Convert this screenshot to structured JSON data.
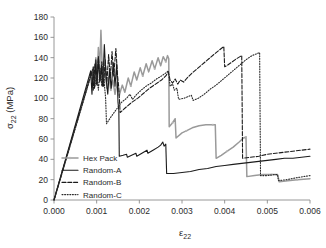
{
  "chart_data": {
    "type": "line",
    "title": "",
    "xlabel": "ε₂₂",
    "xlabel_base": "ε",
    "xlabel_sub": "22",
    "ylabel": "σ₂₂ (MPa)",
    "ylabel_base": "σ",
    "ylabel_sub": "22",
    "ylabel_unit": " (MPa)",
    "xlim": [
      0.0,
      0.006
    ],
    "ylim": [
      0,
      180
    ],
    "xticks": [
      0.0,
      0.001,
      0.002,
      0.003,
      0.004,
      0.005,
      0.006
    ],
    "xtick_labels": [
      "0.000",
      "0.001",
      "0.002",
      "0.003",
      "0.004",
      "0.005",
      "0.006"
    ],
    "yticks": [
      0,
      20,
      40,
      60,
      80,
      100,
      120,
      140,
      160,
      180
    ],
    "ytick_labels": [
      "0",
      "20",
      "40",
      "60",
      "80",
      "100",
      "120",
      "140",
      "160",
      "180"
    ],
    "grid": false,
    "legend_position": "lower-left-inside",
    "series": [
      {
        "name": "Hex Pack",
        "color": "#9a9a9a",
        "style": "solid-marker",
        "width": 1.5,
        "points": [
          [
            0.0,
            0
          ],
          [
            0.0009,
            128
          ],
          [
            0.00094,
            112
          ],
          [
            0.00098,
            140
          ],
          [
            0.00101,
            120
          ],
          [
            0.00104,
            150
          ],
          [
            0.00107,
            128
          ],
          [
            0.0011,
            167
          ],
          [
            0.00114,
            118
          ],
          [
            0.0012,
            126
          ],
          [
            0.00124,
            110
          ],
          [
            0.00129,
            121
          ],
          [
            0.00133,
            108
          ],
          [
            0.00138,
            118
          ],
          [
            0.00143,
            104
          ],
          [
            0.00148,
            116
          ],
          [
            0.00153,
            103
          ],
          [
            0.0016,
            113
          ],
          [
            0.00166,
            106
          ],
          [
            0.00174,
            120
          ],
          [
            0.0018,
            112
          ],
          [
            0.00188,
            126
          ],
          [
            0.00194,
            118
          ],
          [
            0.00202,
            130
          ],
          [
            0.00208,
            122
          ],
          [
            0.00216,
            134
          ],
          [
            0.00222,
            126
          ],
          [
            0.0023,
            137
          ],
          [
            0.00236,
            129
          ],
          [
            0.00244,
            140
          ],
          [
            0.0025,
            132
          ],
          [
            0.00256,
            141
          ],
          [
            0.00262,
            136
          ],
          [
            0.00266,
            142
          ],
          [
            0.00269,
            139
          ],
          [
            0.0027,
            72
          ],
          [
            0.00278,
            76
          ],
          [
            0.00284,
            80
          ],
          [
            0.00286,
            61
          ],
          [
            0.003,
            66
          ],
          [
            0.0031,
            68
          ],
          [
            0.00324,
            71
          ],
          [
            0.0034,
            73
          ],
          [
            0.00356,
            74
          ],
          [
            0.00372,
            74
          ],
          [
            0.00378,
            74
          ],
          [
            0.0038,
            41
          ],
          [
            0.00392,
            44
          ],
          [
            0.00406,
            48
          ],
          [
            0.0042,
            52
          ],
          [
            0.00434,
            57
          ],
          [
            0.00444,
            61
          ],
          [
            0.0045,
            62
          ],
          [
            0.00452,
            23
          ],
          [
            0.0047,
            24
          ],
          [
            0.0049,
            25
          ],
          [
            0.0051,
            25
          ],
          [
            0.00524,
            25
          ],
          [
            0.00528,
            18
          ],
          [
            0.00548,
            19
          ],
          [
            0.0057,
            20
          ],
          [
            0.006,
            21
          ]
        ]
      },
      {
        "name": "Random-A",
        "color": "#1b1b1b",
        "style": "solid",
        "width": 1.1,
        "points": [
          [
            0.0,
            0
          ],
          [
            0.00086,
            127
          ],
          [
            0.00089,
            104
          ],
          [
            0.00092,
            131
          ],
          [
            0.00095,
            110
          ],
          [
            0.00098,
            138
          ],
          [
            0.00101,
            113
          ],
          [
            0.00104,
            141
          ],
          [
            0.00107,
            116
          ],
          [
            0.00111,
            130
          ],
          [
            0.00114,
            112
          ],
          [
            0.00118,
            153
          ],
          [
            0.00122,
            120
          ],
          [
            0.00126,
            104
          ],
          [
            0.0013,
            128
          ],
          [
            0.00134,
            110
          ],
          [
            0.00139,
            135
          ],
          [
            0.00143,
            112
          ],
          [
            0.00147,
            134
          ],
          [
            0.0015,
            96
          ],
          [
            0.00152,
            88
          ],
          [
            0.00153,
            43
          ],
          [
            0.00162,
            44
          ],
          [
            0.0017,
            45
          ],
          [
            0.00172,
            42
          ],
          [
            0.00182,
            44
          ],
          [
            0.00192,
            46
          ],
          [
            0.00194,
            43
          ],
          [
            0.00206,
            46
          ],
          [
            0.00218,
            49
          ],
          [
            0.0022,
            46
          ],
          [
            0.00232,
            49
          ],
          [
            0.00244,
            52
          ],
          [
            0.0025,
            54
          ],
          [
            0.00255,
            57
          ],
          [
            0.00258,
            53
          ],
          [
            0.00262,
            55
          ],
          [
            0.00264,
            26
          ],
          [
            0.0028,
            26
          ],
          [
            0.003,
            27
          ],
          [
            0.0032,
            28
          ],
          [
            0.0034,
            30
          ],
          [
            0.0036,
            31
          ],
          [
            0.0038,
            33
          ],
          [
            0.004,
            34
          ],
          [
            0.0042,
            35
          ],
          [
            0.0044,
            36
          ],
          [
            0.0046,
            37
          ],
          [
            0.0048,
            38
          ],
          [
            0.005,
            39
          ],
          [
            0.0052,
            40
          ],
          [
            0.0054,
            41
          ],
          [
            0.0056,
            41
          ],
          [
            0.0058,
            42
          ],
          [
            0.006,
            43
          ]
        ]
      },
      {
        "name": "Random-B",
        "color": "#1b1b1b",
        "style": "dashed",
        "width": 1.1,
        "points": [
          [
            0.0,
            0
          ],
          [
            0.00088,
            126
          ],
          [
            0.00092,
            108
          ],
          [
            0.00096,
            134
          ],
          [
            0.001,
            114
          ],
          [
            0.00104,
            140
          ],
          [
            0.00108,
            117
          ],
          [
            0.00112,
            136
          ],
          [
            0.00116,
            112
          ],
          [
            0.0012,
            138
          ],
          [
            0.00124,
            116
          ],
          [
            0.00128,
            143
          ],
          [
            0.00132,
            120
          ],
          [
            0.00136,
            146
          ],
          [
            0.0014,
            122
          ],
          [
            0.00145,
            149
          ],
          [
            0.00149,
            122
          ],
          [
            0.00152,
            110
          ],
          [
            0.00155,
            86
          ],
          [
            0.00168,
            91
          ],
          [
            0.00182,
            96
          ],
          [
            0.00196,
            100
          ],
          [
            0.0021,
            105
          ],
          [
            0.00224,
            110
          ],
          [
            0.00238,
            114
          ],
          [
            0.00252,
            118
          ],
          [
            0.00262,
            122
          ],
          [
            0.00268,
            126
          ],
          [
            0.00272,
            118
          ],
          [
            0.00278,
            115
          ],
          [
            0.00284,
            119
          ],
          [
            0.0029,
            114
          ],
          [
            0.00296,
            118
          ],
          [
            0.00304,
            116
          ],
          [
            0.00312,
            120
          ],
          [
            0.00324,
            125
          ],
          [
            0.00338,
            130
          ],
          [
            0.00352,
            135
          ],
          [
            0.00366,
            140
          ],
          [
            0.0038,
            145
          ],
          [
            0.00392,
            149
          ],
          [
            0.00398,
            151
          ],
          [
            0.004,
            131
          ],
          [
            0.00408,
            133
          ],
          [
            0.00418,
            136
          ],
          [
            0.00428,
            139
          ],
          [
            0.00436,
            141
          ],
          [
            0.0044,
            142
          ],
          [
            0.00442,
            41
          ],
          [
            0.0046,
            42
          ],
          [
            0.0048,
            43
          ],
          [
            0.005,
            45
          ],
          [
            0.0052,
            46
          ],
          [
            0.0054,
            47
          ],
          [
            0.0056,
            48
          ],
          [
            0.0058,
            49
          ],
          [
            0.006,
            50
          ]
        ]
      },
      {
        "name": "Random-C",
        "color": "#2a2a2a",
        "style": "dotted",
        "width": 1.1,
        "points": [
          [
            0.0,
            0
          ],
          [
            0.00092,
            130
          ],
          [
            0.00096,
            112
          ],
          [
            0.001,
            124
          ],
          [
            0.00104,
            108
          ],
          [
            0.00108,
            130
          ],
          [
            0.00112,
            112
          ],
          [
            0.00116,
            136
          ],
          [
            0.00118,
            114
          ],
          [
            0.00121,
            100
          ],
          [
            0.00123,
            75
          ],
          [
            0.00134,
            82
          ],
          [
            0.00146,
            89
          ],
          [
            0.00158,
            96
          ],
          [
            0.0017,
            100
          ],
          [
            0.00178,
            104
          ],
          [
            0.00184,
            99
          ],
          [
            0.00192,
            103
          ],
          [
            0.00204,
            108
          ],
          [
            0.00216,
            112
          ],
          [
            0.00228,
            115
          ],
          [
            0.0024,
            119
          ],
          [
            0.00252,
            122
          ],
          [
            0.00262,
            125
          ],
          [
            0.00268,
            127
          ],
          [
            0.00272,
            112
          ],
          [
            0.00278,
            114
          ],
          [
            0.00282,
            108
          ],
          [
            0.00288,
            110
          ],
          [
            0.00292,
            99
          ],
          [
            0.00304,
            100
          ],
          [
            0.00316,
            102
          ],
          [
            0.00322,
            103
          ],
          [
            0.00326,
            98
          ],
          [
            0.00338,
            100
          ],
          [
            0.00352,
            104
          ],
          [
            0.00366,
            109
          ],
          [
            0.0038,
            113
          ],
          [
            0.00394,
            118
          ],
          [
            0.00408,
            123
          ],
          [
            0.00422,
            128
          ],
          [
            0.00436,
            133
          ],
          [
            0.0045,
            138
          ],
          [
            0.00464,
            142
          ],
          [
            0.00476,
            144
          ],
          [
            0.00482,
            145
          ],
          [
            0.00484,
            24
          ],
          [
            0.005,
            24
          ],
          [
            0.00516,
            25
          ],
          [
            0.00524,
            25
          ],
          [
            0.00526,
            19
          ],
          [
            0.00545,
            20
          ],
          [
            0.0057,
            22
          ],
          [
            0.006,
            24
          ]
        ]
      }
    ]
  },
  "legend": {
    "items": [
      {
        "label": "Hex Pack"
      },
      {
        "label": "Random-A"
      },
      {
        "label": "Random-B"
      },
      {
        "label": "Random-C"
      }
    ]
  }
}
